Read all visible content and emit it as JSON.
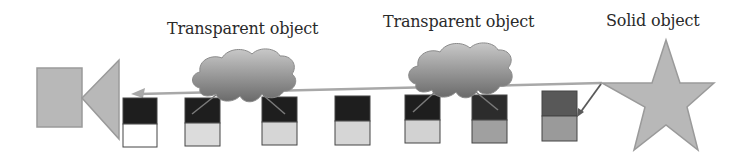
{
  "diagram": {
    "labels": {
      "transparent_1": "Transparent object",
      "transparent_2": "Transparent object",
      "solid": "Solid object"
    },
    "colors": {
      "shape_fill": "#b8b8b8",
      "shape_stroke": "#9a9a9a",
      "ray": "#a0a0a0",
      "reflect_ray": "#6a6a6a",
      "box_dark": "#1e1e1e",
      "box_dark_gray": "#555555",
      "box_white": "#ffffff",
      "box_light": "#d8d8d8",
      "box_medium": "#9c9c9c",
      "box_stroke": "#444444",
      "cloud_top": "#c4c4c4",
      "cloud_bottom": "#6e6e6e"
    },
    "camera": {
      "icon": "camera-icon"
    },
    "solid_object": {
      "icon": "star-icon"
    },
    "transparent_objects": [
      {
        "icon": "cloud-icon"
      },
      {
        "icon": "cloud-icon"
      }
    ],
    "ray_samples": [
      {
        "top": "black",
        "bottom": "white"
      },
      {
        "top": "black",
        "bottom": "light-gray"
      },
      {
        "top": "black",
        "bottom": "light-gray"
      },
      {
        "top": "black",
        "bottom": "light-gray"
      },
      {
        "top": "black",
        "bottom": "light-gray"
      },
      {
        "top": "dark",
        "bottom": "medium-gray"
      },
      {
        "top": "dark-gray",
        "bottom": "medium-gray"
      }
    ]
  }
}
